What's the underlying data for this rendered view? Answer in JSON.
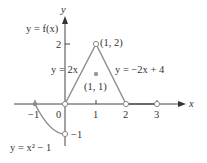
{
  "figure": {
    "function_label": "y = f(x)",
    "axes": {
      "x_label": "x",
      "y_label": "y",
      "x_ticks": [
        "−1",
        "0",
        "1",
        "2",
        "3"
      ],
      "y_ticks": [
        "2",
        "−1"
      ]
    },
    "pieces": [
      {
        "label": "y = x² − 1",
        "domain": "[-1, 0)",
        "type": "parabola"
      },
      {
        "label": "y = 2x",
        "domain": "(0, 1)",
        "type": "line"
      },
      {
        "label": "y = −2x + 4",
        "domain": "(1, 2)",
        "type": "line"
      },
      {
        "label": "y = 0",
        "domain": "(2, 3)",
        "type": "line"
      }
    ],
    "points": [
      {
        "label": "(1, 2)",
        "style": "open"
      },
      {
        "label": "(1, 1)",
        "style": "filled"
      },
      {
        "label": "(0, 0)",
        "style": "open"
      },
      {
        "label": "(0, −1)",
        "style": "open"
      },
      {
        "label": "(2, 0)",
        "style": "open"
      },
      {
        "label": "(3, 0)",
        "style": "open"
      },
      {
        "label": "(−1, 0)",
        "style": "filled"
      }
    ],
    "labels": {
      "fx": "y = f(x)",
      "p12": "(1, 2)",
      "p11": "(1, 1)",
      "left_line": "y = 2x",
      "right_line": "y = −2x + 4",
      "parabola": "y = x² − 1",
      "tick_2": "2",
      "tick_neg1_y": "−1",
      "tick_neg1_x": "−1",
      "tick_0": "0",
      "tick_1": "1",
      "tick_2x": "2",
      "tick_3": "3",
      "axis_x": "x",
      "axis_y": "y"
    },
    "colors": {
      "axis": "#333333",
      "graph": "#8a8a8a",
      "text": "#333333"
    }
  }
}
